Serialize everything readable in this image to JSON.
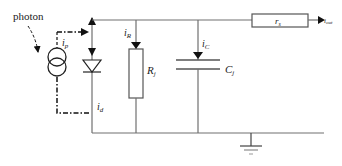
{
  "diagram": {
    "labels": {
      "photon": "photon",
      "ip_main": "i",
      "ip_sub": "p",
      "id_main": "i",
      "id_sub": "d",
      "iR_main": "i",
      "iR_sub": "R",
      "iC_main": "i",
      "iC_sub": "C",
      "Rj_main": "R",
      "Rj_sub": "j",
      "Cj_main": "C",
      "Cj_sub": "j",
      "rs_main": "r",
      "rs_sub": "s",
      "iout_main": "i",
      "iout_sub": "out"
    },
    "components": [
      {
        "type": "current-source",
        "name": "photocurrent source",
        "current": "ip"
      },
      {
        "type": "diode",
        "name": "junction diode",
        "current": "id"
      },
      {
        "type": "resistor",
        "name": "shunt resistance",
        "label": "Rj",
        "current": "iR"
      },
      {
        "type": "capacitor",
        "name": "junction capacitance",
        "label": "Cj",
        "current": "iC"
      },
      {
        "type": "resistor",
        "name": "series resistance",
        "label": "rs"
      },
      {
        "type": "ground",
        "name": "ground"
      }
    ],
    "colors": {
      "wire": "#707070",
      "symbol": "#222222",
      "background": "#ffffff"
    }
  }
}
